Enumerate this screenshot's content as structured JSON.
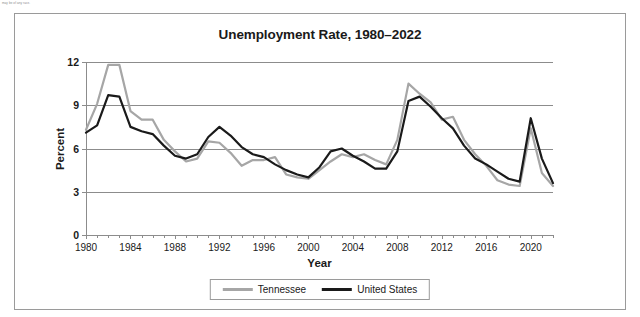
{
  "page": {
    "top_note": "may be of any race."
  },
  "chart": {
    "title": "Unemployment Rate, 1980–2022",
    "xlabel": "Year",
    "ylabel": "Percent",
    "legend": [
      {
        "name": "Tennessee",
        "color": "#a6a6a6"
      },
      {
        "name": "United States",
        "color": "#1a1a1a"
      }
    ]
  },
  "chart_data": {
    "type": "line",
    "title": "Unemployment Rate, 1980–2022",
    "xlabel": "Year",
    "ylabel": "Percent",
    "xlim": [
      1980,
      2022
    ],
    "ylim": [
      0,
      12
    ],
    "yticks": [
      0,
      3,
      6,
      9,
      12
    ],
    "xticks": [
      1980,
      1984,
      1988,
      1992,
      1996,
      2000,
      2004,
      2008,
      2012,
      2016,
      2020
    ],
    "xtick_step": 4,
    "grid": "horizontal",
    "legend_position": "bottom",
    "x": [
      1980,
      1981,
      1982,
      1983,
      1984,
      1985,
      1986,
      1987,
      1988,
      1989,
      1990,
      1991,
      1992,
      1993,
      1994,
      1995,
      1996,
      1997,
      1998,
      1999,
      2000,
      2001,
      2002,
      2003,
      2004,
      2005,
      2006,
      2007,
      2008,
      2009,
      2010,
      2011,
      2012,
      2013,
      2014,
      2015,
      2016,
      2017,
      2018,
      2019,
      2020,
      2021,
      2022
    ],
    "series": [
      {
        "name": "Tennessee",
        "color": "#a6a6a6",
        "values": [
          7.3,
          9.1,
          11.8,
          11.8,
          8.6,
          8.0,
          8.0,
          6.6,
          5.8,
          5.1,
          5.3,
          6.5,
          6.4,
          5.7,
          4.8,
          5.2,
          5.2,
          5.4,
          4.2,
          4.0,
          3.9,
          4.5,
          5.1,
          5.6,
          5.4,
          5.6,
          5.2,
          4.9,
          6.6,
          10.5,
          9.8,
          9.2,
          8.0,
          8.2,
          6.6,
          5.6,
          4.8,
          3.8,
          3.5,
          3.4,
          7.4,
          4.3,
          3.4
        ]
      },
      {
        "name": "United States",
        "color": "#1a1a1a",
        "values": [
          7.1,
          7.6,
          9.7,
          9.6,
          7.5,
          7.2,
          7.0,
          6.2,
          5.5,
          5.3,
          5.6,
          6.8,
          7.5,
          6.9,
          6.1,
          5.6,
          5.4,
          4.9,
          4.5,
          4.2,
          4.0,
          4.7,
          5.8,
          6.0,
          5.5,
          5.1,
          4.6,
          4.6,
          5.8,
          9.3,
          9.6,
          8.9,
          8.1,
          7.4,
          6.2,
          5.3,
          4.9,
          4.4,
          3.9,
          3.7,
          8.1,
          5.3,
          3.6
        ]
      }
    ]
  }
}
